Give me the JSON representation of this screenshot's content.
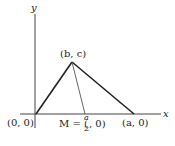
{
  "diagram": {
    "axes": {
      "x_label": "x",
      "y_label": "y"
    },
    "points": {
      "origin": "(0, 0)",
      "apex": "(b, c)",
      "right_vertex": "(a, 0)",
      "midpoint_prefix": "M = (",
      "midpoint_num": "a",
      "midpoint_den": "2",
      "midpoint_suffix": ", 0)"
    },
    "colors": {
      "stroke": "#222222",
      "background": "#ffffff"
    }
  }
}
